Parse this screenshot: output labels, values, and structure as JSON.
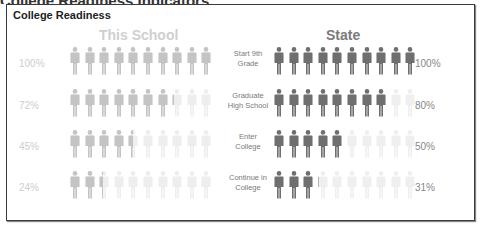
{
  "title": "College Readiness",
  "columns": {
    "school": "This School",
    "state": "State"
  },
  "colors": {
    "school_filled": "#c4c4c4",
    "school_empty": "#eeeeee",
    "state_filled": "#6f6f6f",
    "state_empty": "#efefef"
  },
  "rows": [
    {
      "stage_line1": "Start 9th",
      "stage_line2": "Grade",
      "school_label": "100%",
      "state_label": "100%",
      "school_value": 100,
      "state_value": 100
    },
    {
      "stage_line1": "Graduate",
      "stage_line2": "High School",
      "school_label": "72%",
      "state_label": "80%",
      "school_value": 72,
      "state_value": 80
    },
    {
      "stage_line1": "Enter",
      "stage_line2": "College",
      "school_label": "45%",
      "state_label": "50%",
      "school_value": 45,
      "state_value": 50
    },
    {
      "stage_line1": "Continue in",
      "stage_line2": "College",
      "school_label": "24%",
      "state_label": "31%",
      "school_value": 24,
      "state_value": 31
    }
  ],
  "chart_data": {
    "type": "bar",
    "title": "College Readiness",
    "subtitle": "",
    "categories": [
      "Start 9th Grade",
      "Graduate High School",
      "Enter College",
      "Continue in College"
    ],
    "series": [
      {
        "name": "This School",
        "values": [
          100,
          72,
          45,
          24
        ]
      },
      {
        "name": "State",
        "values": [
          100,
          80,
          50,
          31
        ]
      }
    ],
    "xlabel": "",
    "ylabel": "Percent of students",
    "ylim": [
      0,
      100
    ],
    "units_per_icon": 10,
    "icons_per_row": 10,
    "grid": false,
    "legend": "column headers (This School left, State right)"
  }
}
